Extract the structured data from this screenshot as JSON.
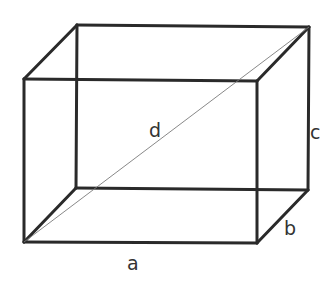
{
  "diagram": {
    "type": "rectangular-box-space-diagonal",
    "colors": {
      "edge": "#2a2a2a",
      "diagonal": "#7a7a7a",
      "label": "#333333",
      "background": "#ffffff"
    },
    "labels": {
      "length": "a",
      "depth": "b",
      "height": "c",
      "diagonal": "d"
    }
  }
}
